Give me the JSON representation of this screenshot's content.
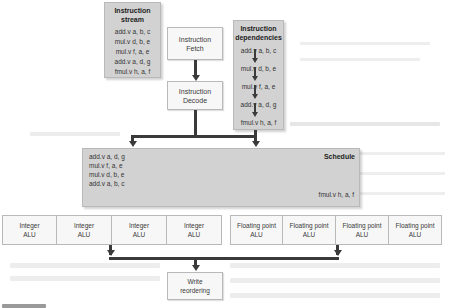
{
  "instruction_stream": {
    "title_line1": "Instruction",
    "title_line2": "stream",
    "instructions": [
      "add.v a, b, c",
      "mul.v d, b, e",
      "mul.v f, a, e",
      "add.v a, d, g",
      "fmul.v h, a, f"
    ]
  },
  "fetch": {
    "line1": "Instruction",
    "line2": "Fetch"
  },
  "decode": {
    "line1": "Instruction",
    "line2": "Decode"
  },
  "dependencies": {
    "title_line1": "Instruction",
    "title_line2": "dependencies",
    "instructions": [
      "add.v a, b, c",
      "mul.v d, b, e",
      "mul.v f, a, e",
      "add.v a, d, g",
      "fmul.v h, a, f"
    ]
  },
  "schedule": {
    "title": "Schedule",
    "integer_queue": [
      "add.v a, d, g",
      "mul.v f, a, e",
      "mul.v d, b, e",
      "add.v a, b, c"
    ],
    "fp_queue": [
      "fmul.v h, a, f"
    ]
  },
  "integer_alus": [
    {
      "line1": "Integer",
      "line2": "ALU"
    },
    {
      "line1": "Integer",
      "line2": "ALU"
    },
    {
      "line1": "Integer",
      "line2": "ALU"
    },
    {
      "line1": "Integer",
      "line2": "ALU"
    }
  ],
  "fp_alus": [
    {
      "line1": "Floating point",
      "line2": "ALU"
    },
    {
      "line1": "Floating point",
      "line2": "ALU"
    },
    {
      "line1": "Floating point",
      "line2": "ALU"
    },
    {
      "line1": "Floating point",
      "line2": "ALU"
    }
  ],
  "write": {
    "line1": "Write",
    "line2": "reordering"
  },
  "colors": {
    "gray_box": "#d2d2d2",
    "white_box": "#f7f7f7",
    "arrow": "#3a3a3a",
    "border": "#b9b9b9"
  }
}
